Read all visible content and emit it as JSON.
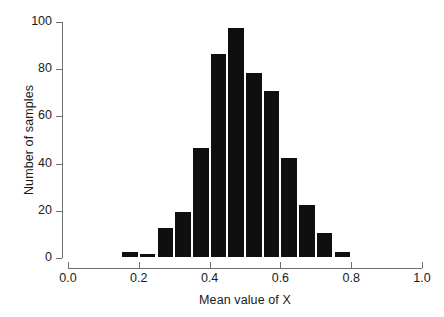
{
  "chart_data": {
    "type": "bar",
    "title": "",
    "subtitle": "",
    "xlabel": "Mean value of X",
    "ylabel": "Number of samples",
    "xlim": [
      0.0,
      1.0
    ],
    "ylim": [
      0,
      100
    ],
    "grid": false,
    "legend": null,
    "bin_width": 0.05,
    "bin_edges": [
      0.15,
      0.2,
      0.25,
      0.3,
      0.35,
      0.4,
      0.45,
      0.5,
      0.55,
      0.6,
      0.65,
      0.7,
      0.75,
      0.8
    ],
    "categories": [
      "0.15-0.20",
      "0.20-0.25",
      "0.25-0.30",
      "0.30-0.35",
      "0.35-0.40",
      "0.40-0.45",
      "0.45-0.50",
      "0.50-0.55",
      "0.55-0.60",
      "0.60-0.65",
      "0.65-0.70",
      "0.70-0.75",
      "0.75-0.80"
    ],
    "bin_centers": [
      0.175,
      0.225,
      0.275,
      0.325,
      0.375,
      0.425,
      0.475,
      0.525,
      0.575,
      0.625,
      0.675,
      0.725,
      0.775
    ],
    "values": [
      3,
      2,
      13,
      20,
      47,
      87,
      98,
      79,
      71,
      43,
      23,
      11,
      3
    ],
    "xticks": [
      0.0,
      0.2,
      0.4,
      0.6,
      0.8,
      1.0
    ],
    "xticklabels": [
      "0.0",
      "0.2",
      "0.4",
      "0.6",
      "0.8",
      "1.0"
    ],
    "yticks": [
      0,
      20,
      40,
      60,
      80,
      100
    ],
    "yticklabels": [
      "0",
      "20",
      "40",
      "60",
      "80",
      "100"
    ],
    "bar_color": "#100f0f",
    "bar_edge_color": "#ffffff",
    "axis_color": "#6f6f6f",
    "background_color": "#ffffff"
  }
}
